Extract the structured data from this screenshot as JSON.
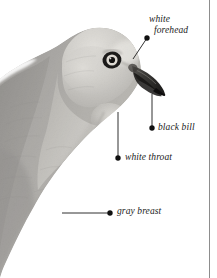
{
  "figure": {
    "style": "grayscale photographic field-guide plate",
    "width": 217,
    "height": 278,
    "background_color": "#ffffff",
    "rule_color": "#8d8d8d"
  },
  "annotations": [
    {
      "id": "white-forehead",
      "line1": "white",
      "line2": "forehead",
      "dot": {
        "x": 147,
        "y": 38
      },
      "leader_end": {
        "x": 133,
        "y": 59
      },
      "leader_type": "diagonal"
    },
    {
      "id": "black-bill",
      "line1": "black bill",
      "line2": "",
      "dot": {
        "x": 152,
        "y": 128
      },
      "leader_end": {
        "x": 152,
        "y": 94
      },
      "leader_type": "vertical"
    },
    {
      "id": "white-throat",
      "line1": "white throat",
      "line2": "",
      "dot": {
        "x": 118,
        "y": 158
      },
      "leader_end": {
        "x": 118,
        "y": 112
      },
      "leader_type": "vertical"
    },
    {
      "id": "gray-breast",
      "line1": "gray breast",
      "line2": "",
      "dot": {
        "x": 110,
        "y": 213
      },
      "leader_end": {
        "x": 62,
        "y": 213
      },
      "leader_type": "horizontal"
    }
  ],
  "colors": {
    "plumage_light": "#c9c6bf",
    "plumage_mid": "#9e9b94",
    "plumage_dark": "#6e6b66",
    "breast_gray": "#7d7a75",
    "bill_black": "#2b2a28",
    "eye_ring": "#1c1b1a",
    "eye_iris": "#d8d5cf",
    "label_text": "#1a1a1a",
    "leader_line": "#1a1a1a"
  }
}
